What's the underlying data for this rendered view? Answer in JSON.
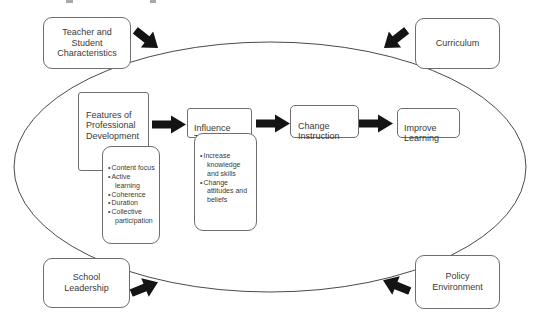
{
  "figure": {
    "type": "conceptual-framework-diagram",
    "colors": {
      "box_border": "#6e6e6e",
      "text": "#3a3a3a",
      "arrow_fill": "#141414",
      "ellipse_stroke": "#4a4a4a",
      "background": "#ffffff"
    },
    "context_boxes": {
      "teacher_student": "Teacher and\nStudent\nCharacteristics",
      "curriculum": "Curriculum",
      "school_leadership": "School\nLeadership",
      "policy_environment": "Policy\nEnvironment"
    },
    "flow_boxes": {
      "features": "Features of\nProfessional\nDevelopment",
      "influence": "Influence\nTeachers",
      "change": "Change\nInstruction",
      "improve": "Improve\nLearning"
    },
    "features_details": [
      "Content focus",
      "Active learning",
      "Coherence",
      "Duration",
      "Collective participation"
    ],
    "influence_details": [
      "Increase knowledge and skills",
      "Change attitudes and beliefs"
    ]
  }
}
